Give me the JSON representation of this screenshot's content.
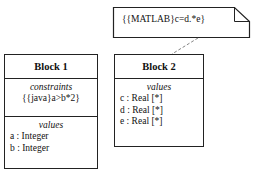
{
  "note": {
    "text": "{{MATLAB}c=d.*e}"
  },
  "blocks": [
    {
      "title": "Block 1",
      "compartments": [
        {
          "title": "constraints",
          "items": [
            "{{java}a>b*2}"
          ]
        },
        {
          "title": "values",
          "items": [
            "a : Integer",
            "b : Integer"
          ]
        }
      ]
    },
    {
      "title": "Block 2",
      "compartments": [
        {
          "title": "values",
          "items": [
            "c : Real [*]",
            "d : Real [*]",
            "e : Real [*]"
          ]
        }
      ]
    }
  ]
}
